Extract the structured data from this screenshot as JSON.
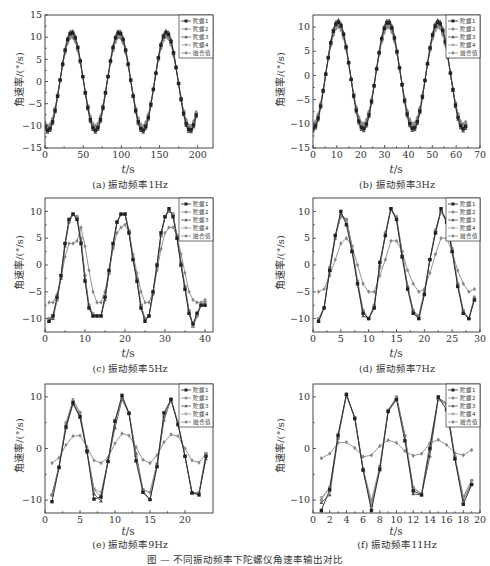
{
  "figure": {
    "caption": "图 — 不同振动频率下陀螺仪角速率输出对比",
    "legend_labels": [
      "陀螺1",
      "陀螺2",
      "陀螺3",
      "陀螺4",
      "融合值"
    ],
    "series_colors": [
      "#222222",
      "#8a8a8a",
      "#555555",
      "#9a9a9a",
      "#888888"
    ],
    "ylabel": "角速率/(°/s)",
    "xlabel_var": "t",
    "xlabel_unit": "/s"
  },
  "chart_data": [
    {
      "id": "a",
      "type": "line",
      "title": "(a) 振动频率1Hz",
      "xlabel": "t/s",
      "ylabel": "角速率/(°/s)",
      "xlim": [
        0,
        220
      ],
      "ylim": [
        -15,
        15
      ],
      "xticks": [
        0,
        50,
        100,
        150,
        200
      ],
      "yticks": [
        -15,
        -10,
        -5,
        0,
        5,
        10,
        15
      ],
      "legend_position": "upper right",
      "period": 62,
      "phase_peak": 35,
      "x_range": [
        0,
        198
      ],
      "series": [
        {
          "name": "陀螺1",
          "amplitude": 11,
          "offset": 0,
          "marker": "square"
        },
        {
          "name": "陀螺2",
          "amplitude": 10.5,
          "offset": 0,
          "marker": "circle"
        },
        {
          "name": "陀螺3",
          "amplitude": 11.5,
          "offset": 0,
          "marker": "triangle-up"
        },
        {
          "name": "陀螺4",
          "amplitude": 10.5,
          "offset": 0,
          "marker": "triangle-down"
        },
        {
          "name": "融合值",
          "amplitude": 10,
          "offset": 0,
          "marker": "diamond"
        }
      ]
    },
    {
      "id": "b",
      "type": "line",
      "title": "(b) 振动频率3Hz",
      "xlabel": "t/s",
      "ylabel": "角速率/(°/s)",
      "xlim": [
        0,
        70
      ],
      "ylim": [
        -15,
        12.5
      ],
      "xticks": [
        0,
        10,
        20,
        30,
        40,
        50,
        60,
        70
      ],
      "yticks": [
        -15,
        -10,
        -5,
        0,
        5,
        10
      ],
      "legend_position": "upper right",
      "period": 21,
      "phase_peak": 10.5,
      "x_range": [
        0,
        64
      ],
      "series": [
        {
          "name": "陀螺1",
          "amplitude": 11,
          "offset": 0,
          "marker": "square"
        },
        {
          "name": "陀螺2",
          "amplitude": 10.5,
          "offset": 0,
          "marker": "circle"
        },
        {
          "name": "陀螺3",
          "amplitude": 11.5,
          "offset": 0,
          "marker": "triangle-up"
        },
        {
          "name": "陀螺4",
          "amplitude": 10.5,
          "offset": 0,
          "marker": "triangle-down"
        },
        {
          "name": "融合值",
          "amplitude": 10,
          "offset": 0,
          "marker": "diamond"
        }
      ]
    },
    {
      "id": "c",
      "type": "line",
      "title": "(c) 振动频率5Hz",
      "xlabel": "t/s",
      "ylabel": "角速率/(°/s)",
      "xlim": [
        0,
        42
      ],
      "ylim": [
        -12.5,
        12.5
      ],
      "xticks": [
        0,
        10,
        20,
        30,
        40
      ],
      "yticks": [
        -10,
        -5,
        0,
        5,
        10
      ],
      "legend_position": "upper right",
      "x": [
        1,
        2,
        3,
        4,
        5,
        6,
        7,
        8,
        9,
        10,
        11,
        12,
        13,
        14,
        15,
        16,
        17,
        18,
        19,
        20,
        21,
        22,
        23,
        24,
        25,
        26,
        27,
        28,
        29,
        30,
        31,
        32,
        33,
        34,
        35,
        36,
        37,
        38,
        39,
        40
      ],
      "series": [
        {
          "name": "陀螺1",
          "values": [
            -10.5,
            -9.5,
            -6,
            -2,
            4,
            8.5,
            9.5,
            8.5,
            4,
            -3,
            -8,
            -9.5,
            -9.5,
            -9.5,
            -6,
            -1,
            4,
            8,
            9.5,
            9.5,
            6,
            1,
            -3,
            -8,
            -10.5,
            -9.5,
            -5,
            0,
            6,
            9,
            10.5,
            9,
            5,
            0,
            -4.5,
            -9,
            -11,
            -9,
            -7.5,
            -7.5
          ]
        },
        {
          "name": "陀螺2",
          "values": [
            -10,
            -9.5,
            -6.5,
            -2,
            4,
            8,
            9.5,
            9,
            5,
            -2,
            -7.5,
            -9.5,
            -9.5,
            -9.5,
            -6,
            -1.5,
            3.5,
            8,
            9.5,
            9.5,
            6.5,
            1.5,
            -2.5,
            -7.5,
            -10,
            -9.5,
            -5.5,
            -0.5,
            5.5,
            9,
            10,
            9.5,
            5.5,
            0.5,
            -4,
            -8.5,
            -11.5,
            -9.5,
            -7.5,
            -7
          ]
        },
        {
          "name": "陀螺3",
          "values": [
            -10.5,
            -10,
            -6.5,
            -2.5,
            3.5,
            8,
            9.5,
            9,
            4.5,
            -2.5,
            -8,
            -9.5,
            -9.5,
            -9.5,
            -6.5,
            -1.5,
            3.5,
            8,
            9.5,
            9.5,
            6,
            1,
            -3,
            -8,
            -10,
            -9.5,
            -5,
            0,
            5.5,
            9,
            10,
            9.5,
            5,
            0,
            -4.5,
            -9,
            -11.5,
            -9.5,
            -7.5,
            -7.5
          ]
        },
        {
          "name": "陀螺4",
          "values": [
            -10,
            -9.5,
            -6.5,
            -2,
            4,
            8,
            9.5,
            9,
            4.5,
            -2,
            -7.5,
            -9,
            -9.5,
            -9.5,
            -6,
            -1.5,
            4,
            8,
            9.5,
            9.5,
            6,
            1.5,
            -2.5,
            -7.5,
            -10,
            -9.5,
            -5.5,
            -0.5,
            5.5,
            9,
            10,
            9.5,
            5,
            0.5,
            -4,
            -8.5,
            -11,
            -9.5,
            -7.5,
            -7
          ]
        },
        {
          "name": "融合值",
          "values": [
            -7,
            -7,
            -5.5,
            -2.5,
            1.5,
            4,
            4,
            4.5,
            7,
            3.5,
            -1,
            -5,
            -7,
            -7,
            -5,
            -1,
            3,
            6,
            7,
            7.5,
            6,
            2,
            -1.5,
            -5,
            -7,
            -7,
            -5,
            -1,
            3,
            6,
            7,
            7,
            5.5,
            2,
            -1.5,
            -5,
            -6.5,
            -7,
            -7,
            -6.5
          ]
        }
      ]
    },
    {
      "id": "d",
      "type": "line",
      "title": "(d) 振动频率7Hz",
      "xlabel": "t/s",
      "ylabel": "角速率/(°/s)",
      "xlim": [
        0,
        30
      ],
      "ylim": [
        -12.5,
        12.5
      ],
      "xticks": [
        0,
        5,
        10,
        15,
        20,
        25,
        30
      ],
      "yticks": [
        -10,
        -5,
        0,
        5,
        10
      ],
      "legend_position": "upper right",
      "x": [
        1,
        2,
        3,
        4,
        5,
        6,
        7,
        8,
        9,
        10,
        11,
        12,
        13,
        14,
        15,
        16,
        17,
        18,
        19,
        20,
        21,
        22,
        23,
        24,
        25,
        26,
        27,
        28,
        29
      ],
      "series": [
        {
          "name": "陀螺1",
          "values": [
            -10.5,
            -8,
            -1,
            5.5,
            10,
            7.5,
            2.5,
            -3.5,
            -9,
            -10,
            -8,
            0.5,
            5.5,
            10.5,
            8.5,
            1.5,
            -4.5,
            -9,
            -10,
            -5.5,
            1,
            6,
            10.5,
            8,
            2.5,
            -4,
            -9,
            -10,
            -6.5
          ]
        },
        {
          "name": "陀螺2",
          "values": [
            -10,
            -8,
            -0.5,
            5.5,
            9,
            8.5,
            3.5,
            -3,
            -8.5,
            -10,
            -7.5,
            -0.5,
            6,
            10.5,
            9,
            2.5,
            -4,
            -8.5,
            -9.5,
            -5,
            1,
            6.5,
            10,
            8.5,
            3,
            -3.5,
            -8.5,
            -10,
            -6
          ]
        },
        {
          "name": "陀螺3",
          "values": [
            -10.5,
            -8,
            -1,
            5,
            9.5,
            8.5,
            3,
            -3.5,
            -9.5,
            -10,
            -8,
            0,
            5.5,
            10.5,
            8.5,
            2,
            -4,
            -8.5,
            -10,
            -5.5,
            1,
            6,
            10,
            8,
            2.5,
            -3.5,
            -9,
            -10,
            -6.5
          ]
        },
        {
          "name": "陀螺4",
          "values": [
            -10,
            -8,
            -0.5,
            5.5,
            9,
            8.5,
            3.5,
            -3,
            -8.5,
            -10,
            -7.5,
            -0.5,
            6,
            10.5,
            8.5,
            2.5,
            -4,
            -8.5,
            -9.5,
            -5,
            1,
            6.5,
            10,
            8.5,
            3,
            -3.5,
            -8.5,
            -10,
            -6
          ]
        },
        {
          "name": "融合值",
          "values": [
            -5,
            -4.5,
            -2,
            1,
            4,
            5,
            3.5,
            0,
            -3.5,
            -5,
            -5,
            -2,
            1,
            4.5,
            4.5,
            2.5,
            -1,
            -3.5,
            -5,
            -4.5,
            -1.5,
            2,
            5,
            5,
            2.5,
            -1,
            -3.5,
            -5,
            -4.5
          ]
        }
      ]
    },
    {
      "id": "e",
      "type": "line",
      "title": "(e) 振动频率9Hz",
      "xlabel": "t/s",
      "ylabel": "角速率/(°/s)",
      "xlim": [
        0,
        24
      ],
      "ylim": [
        -12.5,
        12.5
      ],
      "xticks": [
        0,
        5,
        10,
        15,
        20
      ],
      "yticks": [
        -10,
        0,
        10
      ],
      "legend_position": "upper right",
      "x": [
        1,
        2,
        3,
        4,
        5,
        6,
        7,
        8,
        9,
        10,
        11,
        12,
        13,
        14,
        15,
        16,
        17,
        18,
        19,
        20,
        21,
        22,
        23
      ],
      "series": [
        {
          "name": "陀螺1",
          "values": [
            -10.3,
            -3.7,
            4.2,
            8.9,
            6.2,
            -0.5,
            -9.8,
            -9.4,
            -2.5,
            5.3,
            10.3,
            6.8,
            -2.4,
            -8.5,
            -9.9,
            -3.5,
            6.9,
            9.5,
            4.6,
            -1.5,
            -8.6,
            -9.0,
            -1.5
          ]
        },
        {
          "name": "陀螺2",
          "values": [
            -9.0,
            -3.5,
            4.8,
            9.2,
            7.0,
            -0.5,
            -8.0,
            -9.2,
            -2.5,
            5.2,
            9.8,
            7.0,
            -1.5,
            -8.0,
            -8.5,
            -3.0,
            6.0,
            9.5,
            5.0,
            -1.5,
            -8.6,
            -8.6,
            -1.0
          ]
        },
        {
          "name": "陀螺3",
          "values": [
            -9.0,
            -3.6,
            4.0,
            8.6,
            6.0,
            -0.8,
            -8.8,
            -10.2,
            -2.5,
            4.0,
            9.5,
            6.8,
            -1.0,
            -8.3,
            -9.9,
            -3.5,
            5.5,
            9.5,
            4.8,
            -1.5,
            -8.6,
            -8.6,
            -2.0
          ]
        },
        {
          "name": "陀螺4",
          "values": [
            -9.0,
            -3.5,
            5.0,
            9.5,
            7.0,
            -0.5,
            -7.8,
            -8.5,
            -2.5,
            5.5,
            9.8,
            6.8,
            -1.0,
            -8.0,
            -8.5,
            -3.0,
            6.2,
            9.6,
            5.0,
            -1.5,
            -8.6,
            -8.6,
            -1.0
          ]
        },
        {
          "name": "融合值",
          "values": [
            -2.8,
            -1.8,
            0.7,
            2.4,
            2.5,
            0.3,
            -2.3,
            -2.8,
            -1.8,
            1.0,
            2.9,
            2.5,
            0.3,
            -2.2,
            -2.8,
            -1.3,
            1.2,
            2.7,
            2.4,
            0.0,
            -2.3,
            -2.7,
            -1.0
          ]
        }
      ]
    },
    {
      "id": "f",
      "type": "line",
      "title": "(f) 振动频率11Hz",
      "xlabel": "t/s",
      "ylabel": "角速率/(°/s)",
      "xlim": [
        0,
        20
      ],
      "ylim": [
        -12.5,
        12.5
      ],
      "xticks": [
        0,
        2,
        4,
        6,
        8,
        10,
        12,
        14,
        16,
        18,
        20
      ],
      "yticks": [
        -10,
        0,
        10
      ],
      "legend_position": "upper right",
      "x": [
        1,
        2,
        3,
        4,
        5,
        6,
        7,
        8,
        9,
        10,
        11,
        12,
        13,
        14,
        15,
        16,
        17,
        18,
        19
      ],
      "series": [
        {
          "name": "陀螺1",
          "values": [
            -12,
            -8,
            2.5,
            10.5,
            5.8,
            -4.2,
            -12,
            -4,
            7.2,
            9.5,
            1.5,
            -8.2,
            -9,
            0,
            10,
            7.5,
            -2,
            -10.8,
            -7
          ]
        },
        {
          "name": "陀螺2",
          "values": [
            -10,
            -7.5,
            2,
            10.3,
            6,
            -4,
            -11,
            -3.5,
            7.3,
            10,
            2.5,
            -7.5,
            -8.8,
            1,
            9.5,
            8.5,
            -1.5,
            -9.5,
            -6.2
          ]
        },
        {
          "name": "陀螺3",
          "values": [
            -10.5,
            -9,
            2,
            10.5,
            6,
            -4,
            -11,
            -4.2,
            7.3,
            9.8,
            2.5,
            -8.8,
            -9,
            -1.5,
            9.8,
            8.8,
            -2,
            -10,
            -6.8
          ]
        },
        {
          "name": "陀螺4",
          "values": [
            -9.5,
            -7.8,
            2.8,
            10.3,
            6,
            -4,
            -10,
            -3.5,
            7.5,
            10,
            2.5,
            -7.8,
            -8.8,
            0.5,
            9.5,
            8.5,
            -1.8,
            -9.3,
            -6.2
          ]
        },
        {
          "name": "融合值",
          "values": [
            -1.9,
            -1,
            1.1,
            1.2,
            0.1,
            -1.6,
            -1.3,
            0.5,
            1.6,
            1.1,
            -0.5,
            -1.4,
            -1,
            1,
            1.7,
            0.7,
            -0.9,
            -1.3,
            -0.3
          ]
        }
      ]
    }
  ]
}
